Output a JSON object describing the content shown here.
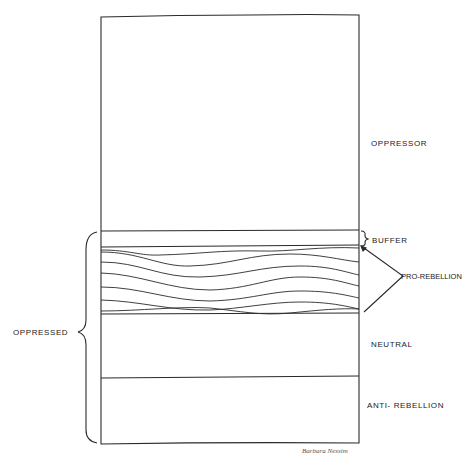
{
  "diagram": {
    "labels": {
      "oppressor": "OPPRESSOR",
      "buffer": "BUFFER",
      "pro_rebellion": "PRO-REBELLION",
      "oppressed": "OPPRESSED",
      "neutral": "NEUTRAL",
      "anti_rebellion": "ANTI- REBELLION"
    },
    "signature": "Barbara Nessim",
    "colors": {
      "line": "#2a2a2a",
      "background": "#ffffff"
    }
  }
}
